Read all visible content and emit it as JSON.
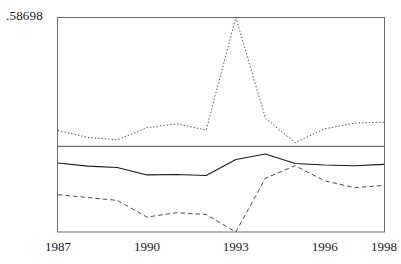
{
  "chart_data": {
    "type": "line",
    "title": "",
    "xlabel": "",
    "ylabel": "",
    "y_axis_top_label": ".58698",
    "grid": false,
    "legend": "none",
    "reference_line": {
      "label": "zero-reference-line",
      "y_value": 0,
      "style": "solid-thin"
    },
    "xlim": [
      1987,
      1998
    ],
    "ylim": [
      -0.39,
      0.58698
    ],
    "x": [
      1987,
      1988,
      1989,
      1990,
      1991,
      1992,
      1993,
      1994,
      1995,
      1996,
      1997,
      1998
    ],
    "tick_labels": [
      "1987",
      "1990",
      "1993",
      "1996",
      "1998"
    ],
    "tick_values": [
      1987,
      1990,
      1993,
      1996,
      1998
    ],
    "series": [
      {
        "name": "upper-band",
        "style": "dotted",
        "values": [
          0.072,
          0.041,
          0.03,
          0.085,
          0.103,
          0.074,
          0.587,
          0.128,
          0.017,
          0.08,
          0.106,
          0.11
        ]
      },
      {
        "name": "central-estimate",
        "style": "solid",
        "values": [
          -0.076,
          -0.09,
          -0.096,
          -0.13,
          -0.128,
          -0.133,
          -0.06,
          -0.035,
          -0.078,
          -0.085,
          -0.088,
          -0.082
        ]
      },
      {
        "name": "lower-band",
        "style": "dashed",
        "values": [
          -0.22,
          -0.233,
          -0.246,
          -0.322,
          -0.302,
          -0.31,
          -0.39,
          -0.145,
          -0.088,
          -0.157,
          -0.188,
          -0.178
        ]
      }
    ]
  },
  "axis": {
    "y_top_label": ".58698",
    "x_labels": [
      {
        "text": "1987",
        "value": 1987
      },
      {
        "text": "1990",
        "value": 1990
      },
      {
        "text": "1993",
        "value": 1993
      },
      {
        "text": "1996",
        "value": 1996
      },
      {
        "text": "1998",
        "value": 1998
      }
    ]
  },
  "style": {
    "frame_color": "#6b6b6b",
    "line_color": "#1a1a1a",
    "dotted_color": "#4d4d4d",
    "dashed_color": "#4d4d4d",
    "background": "#ffffff"
  }
}
